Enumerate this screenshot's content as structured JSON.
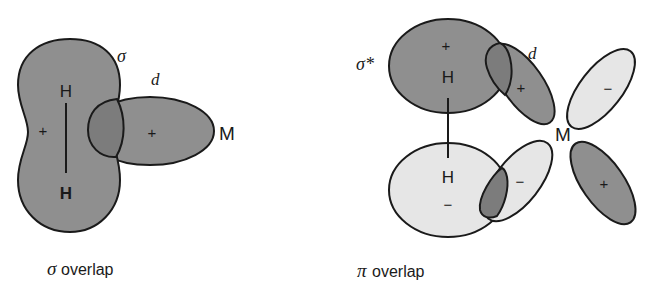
{
  "colors": {
    "dark_lobe": "#8f8f8f",
    "light_lobe": "#e6e6e6",
    "outline": "#1a1a1a",
    "overlap_dark": "#7c7c7c"
  },
  "sigma_diagram": {
    "orbital_label": "σ",
    "d_label": "d",
    "atom_top": "H",
    "atom_bottom": "H",
    "metal": "M",
    "sign_h2": "+",
    "sign_d": "+",
    "caption_symbol": "σ",
    "caption_text": "overlap"
  },
  "pi_diagram": {
    "orbital_label": "σ*",
    "d_label": "d",
    "atom_top": "H",
    "atom_bottom": "H",
    "metal": "M",
    "sign_top_h": "+",
    "sign_bottom_h": "−",
    "sign_d_upper_left": "+",
    "sign_d_upper_right": "−",
    "sign_d_lower_left": "−",
    "sign_d_lower_right": "+",
    "caption_symbol": "π",
    "caption_text": "overlap"
  }
}
